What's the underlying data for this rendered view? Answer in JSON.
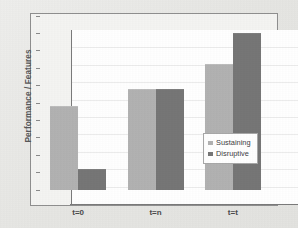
{
  "chart_data": {
    "type": "bar",
    "title": "",
    "xlabel": "",
    "ylabel": "Performance / Features",
    "categories": [
      "t=0",
      "t=n",
      "t=t"
    ],
    "series": [
      {
        "name": "Sustaining",
        "color": "#b2b2b2",
        "values": [
          48,
          58,
          72
        ]
      },
      {
        "name": "Disruptive",
        "color": "#767676",
        "values": [
          12,
          58,
          90
        ]
      }
    ],
    "ylim": [
      0,
      100
    ],
    "y_tick_labels": [],
    "grid": true,
    "legend_position": "inside-bottom-right",
    "annotations": []
  },
  "legend": {
    "entries": [
      {
        "label": "Sustaining",
        "swatch": "#b2b2b2"
      },
      {
        "label": "Disruptive",
        "swatch": "#767676"
      }
    ]
  },
  "axes": {
    "y_title": "Performance / Features",
    "x_categories": [
      "t=0",
      "t=n",
      "t=t"
    ]
  },
  "colors": {
    "sustaining": "#b2b2b2",
    "disruptive": "#767676",
    "plot_background": "#ffffff",
    "chart_background": "#f4f4f2",
    "page_background": "#e9e9e6",
    "frame_border": "#8f8f8f",
    "axis_line": "#7a7a7a",
    "gridline": "#ececec",
    "text": "#4b4b4d"
  }
}
